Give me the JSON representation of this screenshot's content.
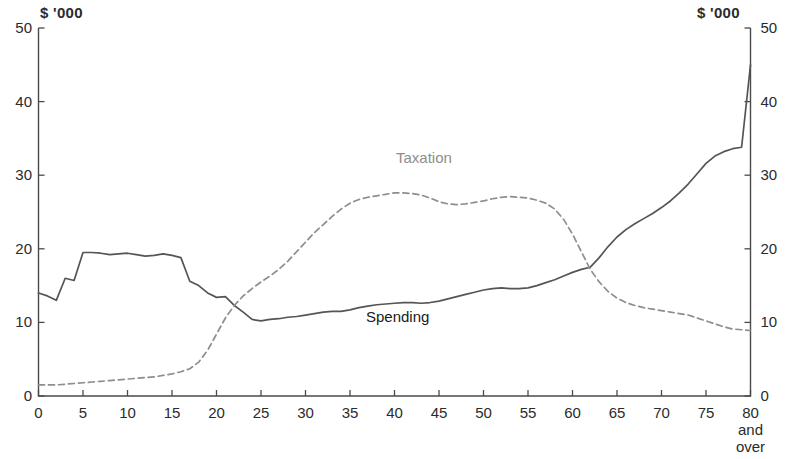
{
  "chart_data": {
    "type": "line",
    "title": "",
    "xlabel": "",
    "ylabel": "",
    "unit_label_left": "$ '000",
    "unit_label_right": "$ '000",
    "xlim": [
      0,
      80
    ],
    "ylim": [
      0,
      50
    ],
    "grid": false,
    "legend_position": "inline-annotations",
    "x_tick_labels": [
      "0",
      "5",
      "10",
      "15",
      "20",
      "25",
      "30",
      "35",
      "40",
      "45",
      "50",
      "55",
      "60",
      "65",
      "70",
      "75",
      "80"
    ],
    "x_tick_values": [
      0,
      5,
      10,
      15,
      20,
      25,
      30,
      35,
      40,
      45,
      50,
      55,
      60,
      65,
      70,
      75,
      80
    ],
    "x_last_tick_extra_lines": [
      "and",
      "over"
    ],
    "y_tick_labels_left": [
      "50",
      "40",
      "30",
      "20",
      "10",
      "0"
    ],
    "y_tick_labels_right": [
      "50",
      "40",
      "30",
      "20",
      "10",
      "0"
    ],
    "y_tick_values": [
      50,
      40,
      30,
      20,
      10,
      0
    ],
    "x": [
      0,
      1,
      2,
      3,
      4,
      5,
      6,
      7,
      8,
      9,
      10,
      11,
      12,
      13,
      14,
      15,
      16,
      17,
      18,
      19,
      20,
      21,
      22,
      23,
      24,
      25,
      26,
      27,
      28,
      29,
      30,
      31,
      32,
      33,
      34,
      35,
      36,
      37,
      38,
      39,
      40,
      41,
      42,
      43,
      44,
      45,
      46,
      47,
      48,
      49,
      50,
      51,
      52,
      53,
      54,
      55,
      56,
      57,
      58,
      59,
      60,
      61,
      62,
      63,
      64,
      65,
      66,
      67,
      68,
      69,
      70,
      71,
      72,
      73,
      74,
      75,
      76,
      77,
      78,
      79,
      80
    ],
    "series": [
      {
        "name": "Spending",
        "color": "#555555",
        "style": "solid",
        "label_text": "Spending",
        "values": [
          14.0,
          13.6,
          13.0,
          16.0,
          15.7,
          19.5,
          19.5,
          19.4,
          19.2,
          19.3,
          19.4,
          19.2,
          19.0,
          19.1,
          19.3,
          19.1,
          18.8,
          15.6,
          15.0,
          14.0,
          13.4,
          13.5,
          12.3,
          11.4,
          10.4,
          10.2,
          10.4,
          10.5,
          10.7,
          10.8,
          11.0,
          11.2,
          11.4,
          11.5,
          11.5,
          11.7,
          12.0,
          12.2,
          12.4,
          12.5,
          12.6,
          12.7,
          12.7,
          12.6,
          12.7,
          12.9,
          13.2,
          13.5,
          13.8,
          14.1,
          14.4,
          14.6,
          14.7,
          14.6,
          14.6,
          14.7,
          15.0,
          15.4,
          15.8,
          16.3,
          16.8,
          17.2,
          17.5,
          18.8,
          20.3,
          21.6,
          22.6,
          23.4,
          24.1,
          24.8,
          25.6,
          26.5,
          27.6,
          28.8,
          30.2,
          31.6,
          32.6,
          33.2,
          33.6,
          33.8,
          45.0
        ]
      },
      {
        "name": "Taxation",
        "color": "#8e8e8e",
        "style": "dashed",
        "label_text": "Taxation",
        "values": [
          1.5,
          1.5,
          1.5,
          1.6,
          1.7,
          1.8,
          1.9,
          2.0,
          2.1,
          2.2,
          2.3,
          2.4,
          2.5,
          2.6,
          2.8,
          3.0,
          3.3,
          3.7,
          4.6,
          6.2,
          8.4,
          10.6,
          12.3,
          13.6,
          14.6,
          15.5,
          16.3,
          17.2,
          18.3,
          19.6,
          20.9,
          22.2,
          23.3,
          24.4,
          25.4,
          26.2,
          26.7,
          27.0,
          27.2,
          27.4,
          27.6,
          27.6,
          27.5,
          27.3,
          26.9,
          26.4,
          26.1,
          26.0,
          26.1,
          26.3,
          26.5,
          26.8,
          27.0,
          27.1,
          27.0,
          26.9,
          26.6,
          26.2,
          25.4,
          24.0,
          22.0,
          19.6,
          17.2,
          15.5,
          14.2,
          13.3,
          12.7,
          12.3,
          12.0,
          11.8,
          11.6,
          11.4,
          11.2,
          11.0,
          10.6,
          10.2,
          9.8,
          9.4,
          9.1,
          9.0,
          8.9
        ]
      }
    ]
  }
}
